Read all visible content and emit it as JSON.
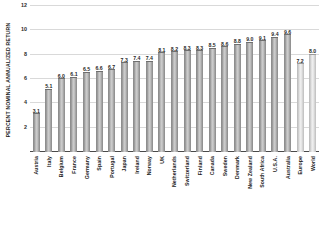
{
  "chart_data": {
    "type": "bar",
    "title": "",
    "xlabel": "",
    "ylabel": "PERCENT NOMINAL ANNUALIZED RETURN",
    "ylim": [
      0,
      12
    ],
    "yticks": [
      2,
      4,
      6,
      8,
      10,
      12
    ],
    "ytick_labels": [
      "2",
      "4",
      "6",
      "8",
      "10",
      "12"
    ],
    "grid": true,
    "legend": "none",
    "categories": [
      "Austria",
      "Italy",
      "Belgium",
      "France",
      "Germany",
      "Spain",
      "Portugal",
      "Japan",
      "Ireland",
      "Norway",
      "UK",
      "Netherlands",
      "Switzerland",
      "Finland",
      "Canada",
      "Sweden",
      "Denmark",
      "New Zealand",
      "South Africa",
      "U.S.A.",
      "Australia",
      "Europe",
      "World"
    ],
    "values": [
      3.1,
      5.1,
      6.0,
      6.1,
      6.5,
      6.6,
      6.7,
      7.3,
      7.4,
      7.4,
      8.1,
      8.2,
      8.3,
      8.3,
      8.5,
      8.6,
      8.8,
      9.0,
      9.1,
      9.4,
      9.6,
      7.2,
      8.0
    ],
    "value_labels": [
      "3.1",
      "5.1",
      "6.0",
      "6.1",
      "6.5",
      "6.6",
      "6.7",
      "7.3",
      "7.4",
      "7.4",
      "8.1",
      "8.2",
      "8.3",
      "8.3",
      "8.5",
      "8.6",
      "8.8",
      "9.0",
      "9.1",
      "9.4",
      "9.6",
      "7.2",
      "8.0"
    ],
    "highlight_flags": [
      false,
      false,
      false,
      false,
      false,
      false,
      false,
      false,
      false,
      false,
      false,
      false,
      false,
      false,
      false,
      false,
      false,
      false,
      false,
      false,
      false,
      true,
      true
    ],
    "colors": {
      "bar_fill": "#c2c2c2",
      "bar_edge": "#8e8e8e",
      "bar_fill_aggregate": "#ebebeb",
      "bar_edge_aggregate": "#b9b9b9",
      "gridline": "#d9d9d9",
      "axis": "#4a4a4a",
      "text": "#1a1a1a",
      "background": "#ffffff"
    }
  }
}
